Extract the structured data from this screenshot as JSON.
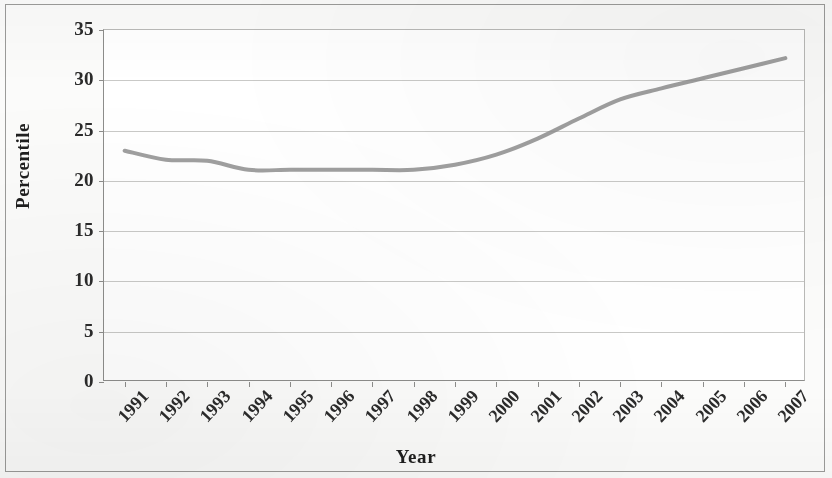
{
  "chart_data": {
    "type": "line",
    "title": "",
    "xlabel": "Year",
    "ylabel": "Percentile",
    "categories": [
      "1991",
      "1992",
      "1993",
      "1994",
      "1995",
      "1996",
      "1997",
      "1998",
      "1999",
      "2000",
      "2001",
      "2002",
      "2003",
      "2004",
      "2005",
      "2006",
      "2007"
    ],
    "values": [
      23.0,
      22.1,
      22.0,
      21.1,
      21.1,
      21.1,
      21.1,
      21.1,
      21.6,
      22.6,
      24.2,
      26.2,
      28.1,
      29.2,
      30.2,
      31.2,
      32.2
    ],
    "series": [
      {
        "name": "Percentile",
        "values": [
          23.0,
          22.1,
          22.0,
          21.1,
          21.1,
          21.1,
          21.1,
          21.1,
          21.6,
          22.6,
          24.2,
          26.2,
          28.1,
          29.2,
          30.2,
          31.2,
          32.2
        ],
        "color": "#8e8e8e"
      }
    ],
    "ylim": [
      0,
      35
    ],
    "ytick_values": [
      0,
      5,
      10,
      15,
      20,
      25,
      30,
      35
    ],
    "ytick_labels": [
      "0",
      "5",
      "10",
      "15",
      "20",
      "25",
      "30",
      "35"
    ],
    "grid": true,
    "grid_axis": "y",
    "legend": false,
    "legend_position": "none",
    "xtick_rotation": -47,
    "line_color": "#8e8e8e",
    "line_width": 4,
    "markers": false,
    "plot_background": "#ffffff",
    "figure_background": "#fbfbfa",
    "border_color": "#9b9b99"
  }
}
